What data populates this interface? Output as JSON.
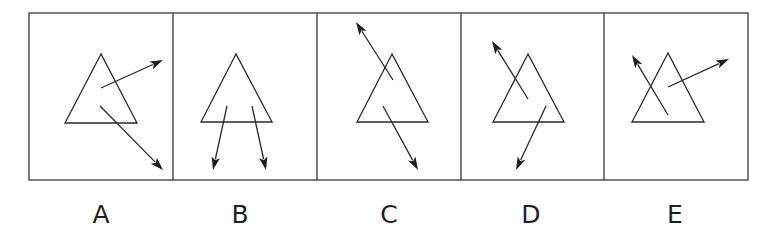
{
  "figure": {
    "options": [
      {
        "label": "A",
        "arrows": [
          {
            "direction": "up-right",
            "starts_inside_triangle": true
          },
          {
            "direction": "down-right",
            "starts_inside_triangle": true
          }
        ]
      },
      {
        "label": "B",
        "arrows": [
          {
            "direction": "down-slightly-left",
            "starts_inside_triangle": true
          },
          {
            "direction": "down-slightly-right",
            "starts_inside_triangle": true
          }
        ]
      },
      {
        "label": "C",
        "arrows": [
          {
            "direction": "up-left",
            "starts_inside_triangle": true
          },
          {
            "direction": "down-right",
            "starts_inside_triangle": true
          }
        ]
      },
      {
        "label": "D",
        "arrows": [
          {
            "direction": "up-left",
            "starts_inside_triangle": true
          },
          {
            "direction": "down-left",
            "starts_inside_triangle": true
          }
        ]
      },
      {
        "label": "E",
        "arrows": [
          {
            "direction": "up-left",
            "starts_inside_triangle": true
          },
          {
            "direction": "up-right",
            "starts_inside_triangle": true
          }
        ]
      }
    ]
  }
}
